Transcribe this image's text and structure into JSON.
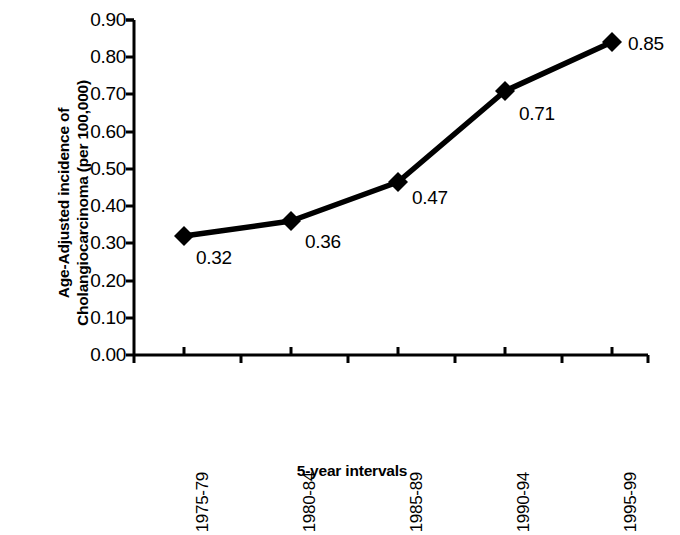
{
  "chart_data": {
    "type": "line",
    "title": "",
    "subtitle": "",
    "xlabel": "5-year intervals",
    "ylabel_line1": "Age-Adjusted incidence of",
    "ylabel_line2": "Cholangiocarcinoma (per 100,000)",
    "categories": [
      "1975-79",
      "1980-84",
      "1985-89",
      "1990-94",
      "1995-99"
    ],
    "values": [
      0.32,
      0.36,
      0.47,
      0.71,
      0.85
    ],
    "point_labels": [
      "0.32",
      "0.36",
      "0.47",
      "0.71",
      "0.85"
    ],
    "ylim": [
      0.0,
      0.9
    ],
    "ytick_values": [
      0.9,
      0.8,
      0.7,
      0.6,
      0.5,
      0.4,
      0.3,
      0.2,
      0.1,
      0.0
    ],
    "ytick_labels": [
      "0.90",
      "0.80",
      "0.70",
      "0.60",
      "0.50",
      "0.40",
      "0.30",
      "0.20",
      "0.10",
      "0.00"
    ],
    "grid": false,
    "legend": "none",
    "marker": "diamond",
    "line_color": "#000000",
    "marker_color": "#000000",
    "background_color": "#ffffff",
    "axis_color": "#000000",
    "xtick_label_rotation": 90
  },
  "geometry": {
    "plot_left": 134,
    "plot_right": 648,
    "plot_top": 20,
    "plot_bottom": 355,
    "point_x": [
      184,
      291,
      398,
      505,
      612
    ],
    "point_y": [
      236,
      221,
      182,
      91,
      42
    ],
    "value_label_pos": [
      {
        "x": 196,
        "y": 247
      },
      {
        "x": 305,
        "y": 231
      },
      {
        "x": 412,
        "y": 187
      },
      {
        "x": 519,
        "y": 103
      },
      {
        "x": 628,
        "y": 33
      }
    ],
    "ytick_y": [
      20,
      57,
      94,
      132,
      169,
      206,
      243,
      281,
      318,
      355
    ],
    "xtick_up_x": [
      184,
      291,
      398,
      505,
      612
    ],
    "xtick_down_x": [
      134,
      241,
      348,
      455,
      562,
      648
    ]
  }
}
